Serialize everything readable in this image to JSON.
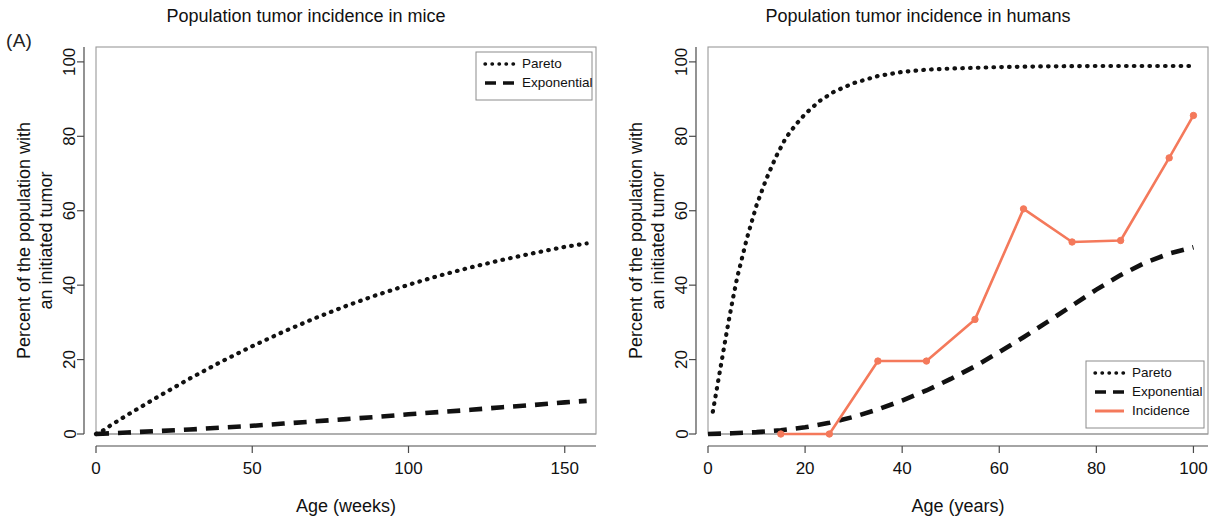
{
  "figure": {
    "panels": [
      {
        "tag": "(A)",
        "title": "Population tumor incidence in mice",
        "xlabel": "Age (weeks)",
        "ylabel_line1": "Percent of the population with",
        "ylabel_line2": "an initiated tumor"
      },
      {
        "tag": "(B)",
        "title": "Population tumor incidence in humans",
        "xlabel": "Age (years)",
        "ylabel_line1": "Percent of the population with",
        "ylabel_line2": "an initiated tumor"
      }
    ]
  },
  "colors": {
    "incidence": "#F4795B",
    "model_line": "#111111",
    "axis": "#4a4a4a",
    "box": "#9a9a9a"
  },
  "chart_data": [
    {
      "type": "line",
      "panel": "A",
      "title": "Population tumor incidence in mice",
      "xlabel": "Age (weeks)",
      "ylabel": "Percent of the population with an initiated tumor",
      "xlim": [
        0,
        160
      ],
      "ylim": [
        0,
        104
      ],
      "xticks": [
        0,
        50,
        100,
        150
      ],
      "yticks": [
        0,
        20,
        40,
        60,
        80,
        100
      ],
      "grid": false,
      "legend_position": "top-right",
      "series": [
        {
          "name": "Pareto",
          "style": "dotted",
          "color": "#111111",
          "x": [
            0,
            2,
            5,
            10,
            15,
            20,
            25,
            30,
            40,
            50,
            60,
            70,
            80,
            90,
            100,
            110,
            120,
            130,
            140,
            150,
            157
          ],
          "values": [
            0,
            0.8,
            2.5,
            5.1,
            7.6,
            10.1,
            12.5,
            14.9,
            19.4,
            23.6,
            27.5,
            31.1,
            34.4,
            37.4,
            40.1,
            42.6,
            44.8,
            46.8,
            48.6,
            50.3,
            51.2
          ]
        },
        {
          "name": "Exponential",
          "style": "dashed",
          "color": "#111111",
          "x": [
            0,
            5,
            10,
            20,
            30,
            40,
            50,
            60,
            70,
            80,
            90,
            100,
            110,
            120,
            130,
            140,
            150,
            157
          ],
          "values": [
            0,
            0.2,
            0.4,
            0.8,
            1.2,
            1.7,
            2.2,
            2.8,
            3.4,
            4.0,
            4.6,
            5.3,
            5.9,
            6.5,
            7.2,
            7.8,
            8.5,
            8.9
          ]
        }
      ]
    },
    {
      "type": "line",
      "panel": "B",
      "title": "Population tumor incidence in humans",
      "xlabel": "Age (years)",
      "ylabel": "Percent of the population with an initiated tumor",
      "xlim": [
        0,
        103
      ],
      "ylim": [
        0,
        104
      ],
      "xticks": [
        0,
        20,
        40,
        60,
        80,
        100
      ],
      "yticks": [
        0,
        20,
        40,
        60,
        80,
        100
      ],
      "grid": false,
      "legend_position": "bottom-right",
      "series": [
        {
          "name": "Pareto",
          "style": "dotted",
          "color": "#111111",
          "x": [
            1,
            2,
            3,
            4,
            5,
            6,
            8,
            10,
            12,
            14,
            16,
            18,
            20,
            23,
            26,
            30,
            35,
            40,
            45,
            50,
            60,
            70,
            80,
            90,
            100
          ],
          "values": [
            6.0,
            13.5,
            21.0,
            28.5,
            35.5,
            42.0,
            52.5,
            61.5,
            68.5,
            74.5,
            79.5,
            83.0,
            86.0,
            89.5,
            92.0,
            94.3,
            96.2,
            97.3,
            97.9,
            98.2,
            98.6,
            98.8,
            98.9,
            98.9,
            98.9
          ]
        },
        {
          "name": "Exponential",
          "style": "dashed",
          "color": "#111111",
          "x": [
            0,
            5,
            10,
            15,
            20,
            25,
            30,
            35,
            40,
            45,
            50,
            55,
            60,
            65,
            70,
            75,
            80,
            85,
            90,
            95,
            100
          ],
          "values": [
            0,
            0.2,
            0.5,
            1.0,
            1.8,
            3.0,
            4.6,
            6.6,
            9.0,
            11.7,
            14.8,
            18.2,
            22.0,
            26.0,
            30.2,
            34.5,
            38.8,
            42.7,
            46.0,
            48.5,
            50.2
          ]
        },
        {
          "name": "Incidence",
          "style": "solid",
          "color": "#F4795B",
          "markers": true,
          "x": [
            15,
            25,
            35,
            45,
            55,
            65,
            75,
            85,
            95,
            100
          ],
          "values": [
            0,
            0,
            19.6,
            19.6,
            30.8,
            60.5,
            51.6,
            52.0,
            74.2,
            85.6
          ]
        }
      ]
    }
  ],
  "legends": {
    "panel_a": [
      {
        "label": "Pareto",
        "style": "dotted"
      },
      {
        "label": "Exponential",
        "style": "dashed"
      }
    ],
    "panel_b": [
      {
        "label": "Pareto",
        "style": "dotted"
      },
      {
        "label": "Exponential",
        "style": "dashed"
      },
      {
        "label": "Incidence",
        "style": "solid"
      }
    ]
  }
}
